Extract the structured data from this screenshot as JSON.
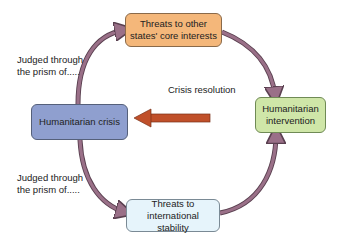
{
  "diagram": {
    "nodes": {
      "top": {
        "label": "Threats to other states' core interests",
        "color": "#f4b77a"
      },
      "left": {
        "label": "Humanitarian crisis",
        "color": "#8f9fcf"
      },
      "right": {
        "label": "Humanitarian intervention",
        "color": "#cfe6a8"
      },
      "bottom": {
        "label": "Threats to international stability",
        "color": "#e6f4fb"
      }
    },
    "labels": {
      "top_left_line1": "Judged through",
      "top_left_line2": "the prism of.....",
      "bottom_left_line1": "Judged through",
      "bottom_left_line2": "the prism of.....",
      "crisis_resolution": "Crisis resolution"
    },
    "colors": {
      "cycle_arrow": "#9a7088",
      "resolution_arrow": "#c0502a"
    }
  }
}
